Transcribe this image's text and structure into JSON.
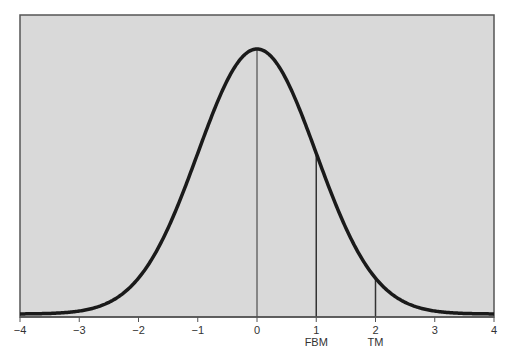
{
  "chart_data": {
    "type": "line",
    "title": "",
    "xlabel": "",
    "ylabel": "",
    "xlim": [
      -4,
      4
    ],
    "ylim": [
      0,
      0.42
    ],
    "grid": false,
    "legend": null,
    "x_ticks": [
      -4,
      -3,
      -2,
      -1,
      0,
      1,
      2,
      3,
      4
    ],
    "x_tick_labels": [
      "−4",
      "−3",
      "−2",
      "−1",
      "0",
      "1",
      "2",
      "3",
      "4"
    ],
    "series": [
      {
        "name": "standard normal density",
        "function": "exp(-x^2/2)/sqrt(2*pi)",
        "x": [
          -4,
          -3,
          -2,
          -1,
          0,
          1,
          2,
          3,
          4
        ],
        "values": [
          0.0001,
          0.0044,
          0.054,
          0.242,
          0.399,
          0.242,
          0.054,
          0.0044,
          0.0001
        ]
      }
    ],
    "annotations": [
      {
        "x": 0,
        "label": "",
        "type": "vertical-line"
      },
      {
        "x": 1,
        "label": "FBM",
        "type": "vertical-line"
      },
      {
        "x": 2,
        "label": "TM",
        "type": "vertical-line"
      }
    ],
    "colors": {
      "background": "#d9d9d9",
      "curve": "#1a1a1a",
      "frame": "#555555"
    }
  }
}
